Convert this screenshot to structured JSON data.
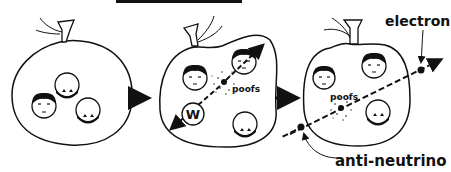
{
  "diagram": {
    "title_bar_visible": true,
    "panels": [
      {
        "id": "panel-1",
        "description": "nucleus bag with two protons and one neutron"
      },
      {
        "id": "panel-2",
        "description": "neutron emits W boson",
        "w_label": "W",
        "poof_label": "poofs"
      },
      {
        "id": "panel-3",
        "description": "W decays to electron and anti-neutrino",
        "poof_label": "poofs"
      }
    ],
    "labels": {
      "electron": "electron",
      "anti_neutrino": "anti-neutrino",
      "w": "W",
      "poof_mid": "poofs",
      "poof_right": "poofs"
    },
    "colors": {
      "ink": "#111111",
      "background": "#ffffff"
    }
  }
}
